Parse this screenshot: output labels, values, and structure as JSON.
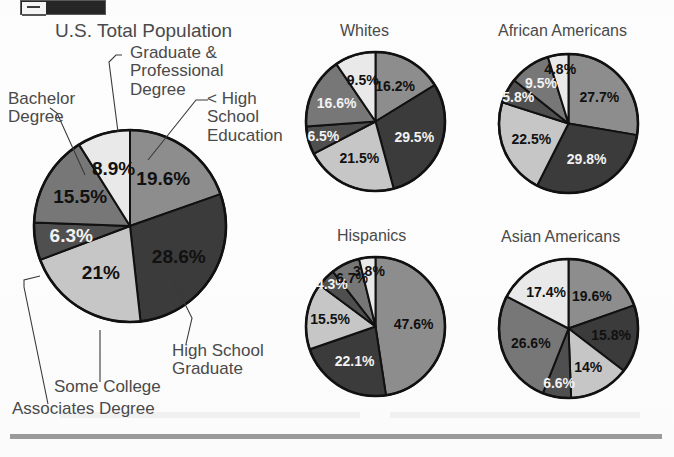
{
  "page": {
    "background_color": "#fdfdfd",
    "text_color": "#4a4a4a",
    "rule_color": "#9a9a9a"
  },
  "palette": {
    "slice_1_less_than_hs": "#8d8d8d",
    "slice_2_hs_grad": "#3b3b3b",
    "slice_3_some_college": "#c6c6c6",
    "slice_4_associates": "#4f4f4f",
    "slice_5_bachelor": "#777777",
    "slice_6_graduate": "#e9e9e9",
    "outline": "#111111"
  },
  "callouts": {
    "graduate_professional": "Graduate &\nProfessional\nDegree",
    "less_than_high_school": "< High\nSchool\nEducation",
    "bachelor_degree": "Bachelor\nDegree",
    "high_school_graduate": "High School\nGraduate",
    "some_college": "Some College",
    "associates_degree": "Associates Degree"
  },
  "chart_data": [
    {
      "type": "pie",
      "title": "U.S. Total Population",
      "start_angle": 0,
      "direction": "clockwise",
      "categories": [
        "< High School Education",
        "High School Graduate",
        "Some College",
        "Associates Degree",
        "Bachelor Degree",
        "Graduate & Professional Degree"
      ],
      "values": [
        19.6,
        28.6,
        21,
        6.3,
        15.5,
        8.9
      ],
      "labels": [
        "19.6%",
        "28.6%",
        "21%",
        "6.3%",
        "15.5%",
        "8.9%"
      ],
      "label_colors": [
        "dark",
        "dark",
        "dark",
        "light",
        "dark",
        "dark"
      ]
    },
    {
      "type": "pie",
      "title": "Whites",
      "start_angle": 0,
      "direction": "clockwise",
      "categories": [
        "< High School Education",
        "High School Graduate",
        "Some College",
        "Associates Degree",
        "Bachelor Degree",
        "Graduate & Professional Degree"
      ],
      "values": [
        16.2,
        29.5,
        21.5,
        6.5,
        16.6,
        9.5
      ],
      "labels": [
        "16.2%",
        "29.5%",
        "21.5%",
        "6.5%",
        "16.6%",
        "9.5%"
      ],
      "label_colors": [
        "dark",
        "light",
        "dark",
        "light",
        "light",
        "dark"
      ]
    },
    {
      "type": "pie",
      "title": "African Americans",
      "start_angle": 0,
      "direction": "clockwise",
      "categories": [
        "< High School Education",
        "High School Graduate",
        "Some College",
        "Associates Degree",
        "Bachelor Degree",
        "Graduate & Professional Degree"
      ],
      "values": [
        27.7,
        29.8,
        22.5,
        5.8,
        9.5,
        4.8
      ],
      "labels": [
        "27.7%",
        "29.8%",
        "22.5%",
        "5.8%",
        "9.5%",
        "4.8%"
      ],
      "label_colors": [
        "dark",
        "light",
        "dark",
        "light",
        "light",
        "dark"
      ]
    },
    {
      "type": "pie",
      "title": "Hispanics",
      "start_angle": 0,
      "direction": "clockwise",
      "categories": [
        "< High School Education",
        "High School Graduate",
        "Some College",
        "Associates Degree",
        "Bachelor Degree",
        "Graduate & Professional Degree"
      ],
      "values": [
        47.6,
        22.1,
        15.5,
        4.3,
        6.7,
        3.8
      ],
      "labels": [
        "47.6%",
        "22.1%",
        "15.5%",
        "4.3%",
        "6.7%",
        "3.8%"
      ],
      "label_colors": [
        "dark",
        "light",
        "dark",
        "light",
        "dark",
        "dark"
      ]
    },
    {
      "type": "pie",
      "title": "Asian Americans",
      "start_angle": 0,
      "direction": "clockwise",
      "categories": [
        "< High School Education",
        "High School Graduate",
        "Some College",
        "Associates Degree",
        "Bachelor Degree",
        "Graduate & Professional Degree"
      ],
      "values": [
        19.6,
        15.8,
        14,
        6.6,
        26.6,
        17.4
      ],
      "labels": [
        "19.6%",
        "15.8%",
        "14%",
        "6.6%",
        "26.6%",
        "17.4%"
      ],
      "label_colors": [
        "dark",
        "dark",
        "dark",
        "light",
        "dark",
        "dark"
      ]
    }
  ]
}
